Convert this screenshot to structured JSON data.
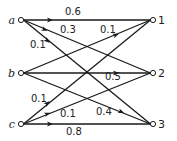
{
  "diagram": {
    "type": "bipartite-transition-graph",
    "sources": [
      {
        "id": "a",
        "label": "a",
        "x": 21,
        "y": 20
      },
      {
        "id": "b",
        "label": "b",
        "x": 21,
        "y": 73
      },
      {
        "id": "c",
        "label": "c",
        "x": 21,
        "y": 124
      }
    ],
    "targets": [
      {
        "id": "1",
        "label": "1",
        "x": 153,
        "y": 20
      },
      {
        "id": "2",
        "label": "2",
        "x": 153,
        "y": 73
      },
      {
        "id": "3",
        "label": "3",
        "x": 153,
        "y": 124
      }
    ],
    "edges": [
      {
        "from": "a",
        "to": "1",
        "weight": "0.6",
        "label_x": 65,
        "label_y": 15,
        "arrow_t": 0.22
      },
      {
        "from": "a",
        "to": "2",
        "weight": "0.3",
        "label_x": 60,
        "label_y": 33,
        "arrow_t": 0.18
      },
      {
        "from": "a",
        "to": "3",
        "weight": "0.1",
        "label_x": 30,
        "label_y": 48,
        "arrow_t": 0.2
      },
      {
        "from": "b",
        "to": "1",
        "weight": "0.1",
        "label_x": 100,
        "label_y": 33,
        "arrow_t": 0.72
      },
      {
        "from": "b",
        "to": "2",
        "weight": "0.5",
        "label_x": 105,
        "label_y": 80,
        "arrow_t": 0.72
      },
      {
        "from": "b",
        "to": "3",
        "weight": "0.4",
        "label_x": 96,
        "label_y": 115,
        "arrow_t": 0.76
      },
      {
        "from": "c",
        "to": "1",
        "weight": "0.1",
        "label_x": 31,
        "label_y": 102,
        "arrow_t": 0.2
      },
      {
        "from": "c",
        "to": "2",
        "weight": "0.1",
        "label_x": 60,
        "label_y": 117,
        "arrow_t": 0.2
      },
      {
        "from": "c",
        "to": "3",
        "weight": "0.8",
        "label_x": 66,
        "label_y": 135,
        "arrow_t": 0.22
      }
    ]
  }
}
